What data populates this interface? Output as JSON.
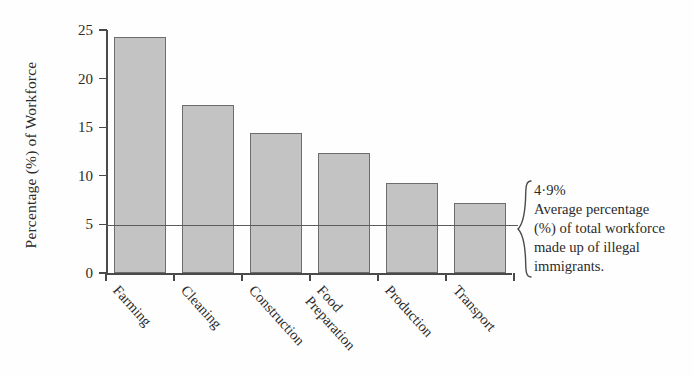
{
  "chart_data": {
    "type": "bar",
    "title": "",
    "xlabel": "",
    "ylabel": "Percentage (%) of Workforce",
    "categories": [
      "Farming",
      "Cleaning",
      "Construction",
      "Food Preparation",
      "Production",
      "Transport"
    ],
    "values": [
      24.3,
      17.3,
      14.4,
      12.3,
      9.3,
      7.2
    ],
    "ylim": [
      0,
      25
    ],
    "yticks": [
      0,
      5,
      10,
      15,
      20,
      25
    ],
    "ytick_labels": [
      "0",
      "5",
      "10",
      "15",
      "20",
      "25"
    ],
    "grid": false,
    "legend": "none",
    "bar_color": "#c3c3c3",
    "bar_border_color": "#6d6d6d",
    "axis_color": "#4a4a4a",
    "annotations": [
      {
        "name": "average-line",
        "value": 4.9,
        "line_color": "#5d5d5d",
        "lines": [
          "4·9%",
          "Average percentage",
          "(%) of total workforce",
          "made up of illegal",
          "immigrants."
        ]
      }
    ]
  },
  "category_label_lines": [
    [
      "Farming"
    ],
    [
      "Cleaning"
    ],
    [
      "Construction"
    ],
    [
      "Food",
      "Preparation"
    ],
    [
      "Production"
    ],
    [
      "Transport"
    ]
  ]
}
